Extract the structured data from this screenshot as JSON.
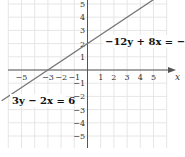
{
  "chart_data": {
    "type": "line",
    "title": "",
    "xlabel": "x",
    "ylabel": "",
    "xlim": [
      -6,
      6
    ],
    "ylim": [
      -5.7,
      5.4
    ],
    "grid": true,
    "x_ticks": [
      -5,
      -3,
      -2,
      -1,
      1,
      2,
      3,
      4,
      5
    ],
    "x_tick_labels": [
      "−5",
      "−3",
      "−2",
      "−1",
      "1",
      "2",
      "3",
      "4",
      "5"
    ],
    "y_ticks": [
      5,
      4,
      3,
      2,
      1,
      -1,
      -2,
      -3,
      -4,
      -5
    ],
    "y_tick_labels": [
      "5",
      "4",
      "3",
      "2",
      "1",
      "−1",
      "−2",
      "−3",
      "−4",
      "−5"
    ],
    "series": [
      {
        "name": "−12y + 8x = −24 and 3y − 2x = 6 (same line: y = (2/3)x + 2)",
        "x": [
          -6.5,
          5.3
        ],
        "y": [
          -2.333,
          5.533
        ],
        "color": "#777777"
      }
    ],
    "annotations": [
      {
        "text": "−12y + 8x = −24",
        "near": [
          2.5,
          2.5
        ]
      },
      {
        "text": "3y − 2x = 6",
        "near": [
          -4.5,
          -1.5
        ]
      }
    ]
  },
  "labels": {
    "eq1": "−12y + 8x = −24",
    "eq2": "3y − 2x = 6",
    "x_axis": "x"
  },
  "colors": {
    "grid": "#e6e6e6",
    "axis": "#555555",
    "line": "#777777"
  }
}
